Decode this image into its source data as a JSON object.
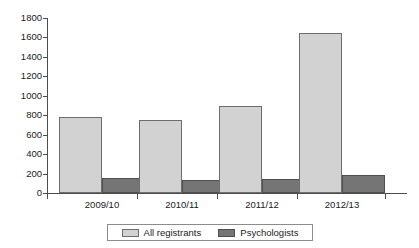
{
  "chart_data": {
    "type": "bar",
    "title": "",
    "subtitle": "",
    "xlabel": "",
    "ylabel": "",
    "categories": [
      "2009/10",
      "2010/11",
      "2011/12",
      "2012/13"
    ],
    "series": [
      {
        "name": "All registrants",
        "color": "#d2d2d2",
        "values": [
          780,
          755,
          900,
          1645
        ]
      },
      {
        "name": "Psychologists",
        "color": "#757575",
        "values": [
          155,
          130,
          145,
          185
        ]
      }
    ],
    "ylim": [
      0,
      1800
    ],
    "ytick_labels": [
      "0",
      "200",
      "400",
      "600",
      "800",
      "1000",
      "1200",
      "1400",
      "1600",
      "1800"
    ],
    "ytick_values": [
      0,
      200,
      400,
      600,
      800,
      1000,
      1200,
      1400,
      1600,
      1800
    ],
    "ytick_step": 200,
    "grid": false,
    "legend_position": "bottom",
    "legend_entries": [
      "All registrants",
      "Psychologists"
    ],
    "axis_color": "#4d4d4d",
    "background": "#ffffff"
  }
}
